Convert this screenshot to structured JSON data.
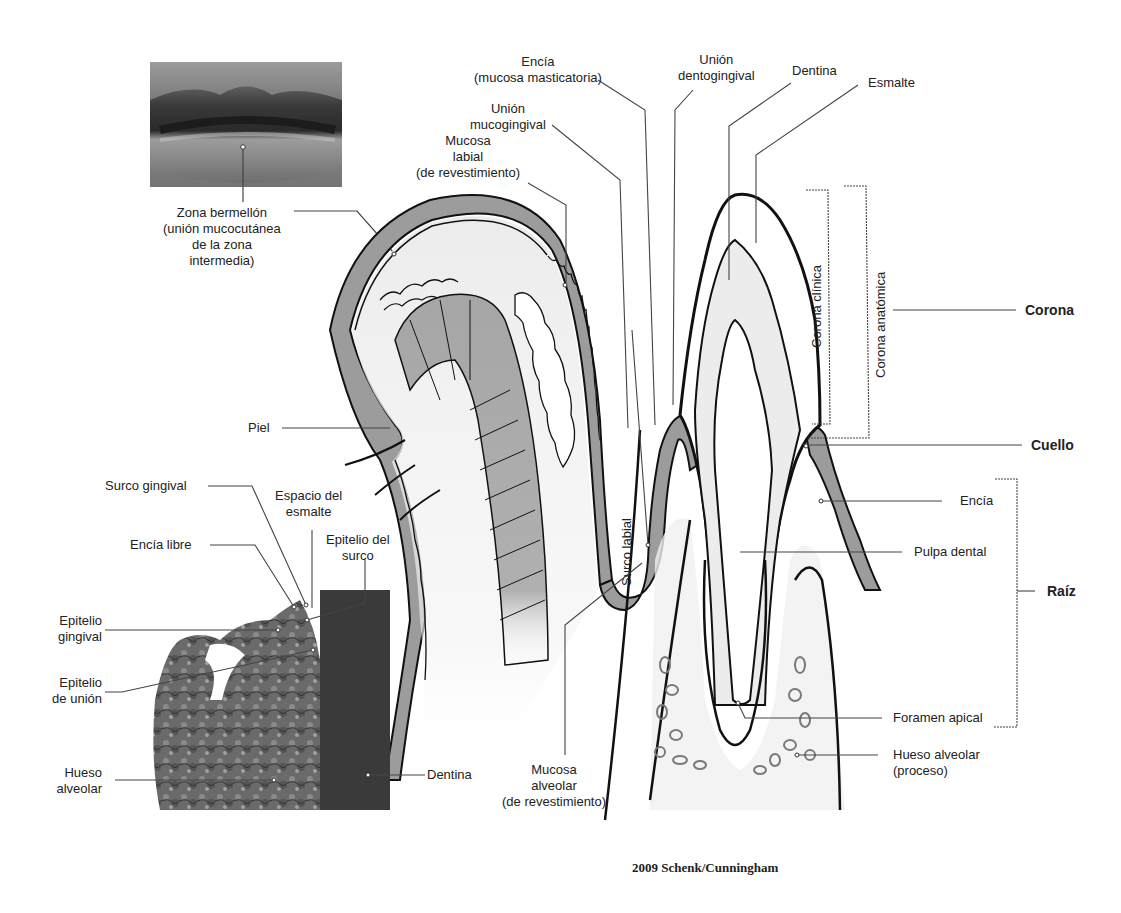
{
  "figure": {
    "credit": "2009 Schenk/Cunningham",
    "colors": {
      "line": "#111111",
      "mucosa_gray": "#9a9a9a",
      "light_fill": "#ececec",
      "muscle": "#a8a8a8",
      "photo_dark": "#3a3a3a",
      "leader": "#555555"
    }
  },
  "photo_labels": {
    "lips_photo": "lips-photo",
    "histology_photo": "histology-photo"
  },
  "labels": {
    "zona_bermellon": [
      "Zona bermellón",
      "(unión mucocutánea",
      "de la zona",
      "intermedia)"
    ],
    "piel": "Piel",
    "surco_gingival": "Surco gingival",
    "encia_libre": "Encía libre",
    "espacio_esmalte": [
      "Espacio del",
      "esmalte"
    ],
    "epitelio_surco": [
      "Epitelio del",
      "surco"
    ],
    "epitelio_gingival": [
      "Epitelio",
      "gingival"
    ],
    "epitelio_union": [
      "Epitelio",
      "de unión"
    ],
    "hueso_alveolar_left": [
      "Hueso",
      "alveolar"
    ],
    "dentina_left": "Dentina",
    "mucosa_labial": [
      "Mucosa",
      "labial",
      "(de revestimiento)"
    ],
    "encia_masticatoria": [
      "Encía",
      "(mucosa masticatoria)"
    ],
    "union_mucogingival": [
      "Unión",
      "mucogingival"
    ],
    "union_dentogingival": [
      "Unión",
      "dentogingival"
    ],
    "dentina_top": "Dentina",
    "esmalte": "Esmalte",
    "surco_labial": "Surco labial",
    "mucosa_alveolar": [
      "Mucosa",
      "alveolar",
      "(de revestimiento)"
    ],
    "corona_clinica": "Corona clínica",
    "corona_anatomica": "Corona anatómica",
    "corona": "Corona",
    "cuello": "Cuello",
    "encia_right": "Encía",
    "pulpa_dental": "Pulpa dental",
    "raiz": "Raíz",
    "foramen_apical": "Foramen apical",
    "hueso_alveolar_right": [
      "Hueso alveolar",
      "(proceso)"
    ]
  }
}
